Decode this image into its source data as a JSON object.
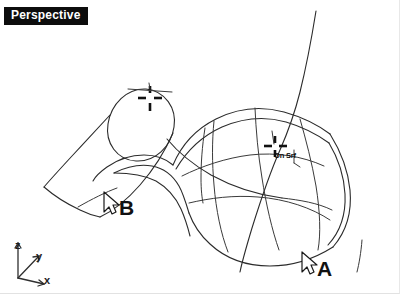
{
  "viewport": {
    "title": "Perspective",
    "background_color": "#ffffff",
    "wire_color": "#2b2b2b",
    "title_bg_color": "#0d0d0d",
    "title_text_color": "#ffffff"
  },
  "osnap": {
    "label": "On Srf",
    "marker_name": "surface-snap-crosshair"
  },
  "annotations": {
    "label_a": "A",
    "label_b": "B"
  },
  "axis_gizmo": {
    "z": "z",
    "y": "y",
    "x": "x"
  },
  "copyright": {
    "text": "© 2014 Cengage Learning®. All Rights Reserved."
  },
  "cursors": [
    {
      "name": "cursor-arrow-a",
      "x": 300,
      "y": 252
    },
    {
      "name": "cursor-arrow-b",
      "x": 102,
      "y": 192
    }
  ],
  "geometry": {
    "left_object": "cone-wireframe-with-ellipse-top",
    "right_object": "nurbs-surface-wireframe-with-isocurves",
    "sweep_curve": "vertical-rail-curve"
  }
}
